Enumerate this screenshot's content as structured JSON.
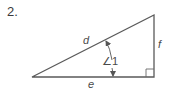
{
  "problem": {
    "number": "2."
  },
  "figure": {
    "type": "right-triangle",
    "stroke_color": "#555555",
    "sides": {
      "hypotenuse": "d",
      "vertical_leg": "f",
      "horizontal_leg": "e"
    },
    "angle": {
      "symbol": "∠",
      "label": "1",
      "full_label": "∠1"
    },
    "right_angle_marker": true
  }
}
